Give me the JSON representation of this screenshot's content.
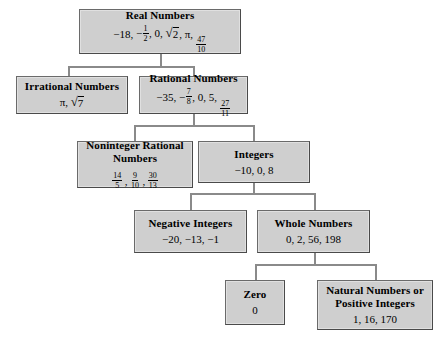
{
  "diagram": {
    "type": "tree",
    "fill_color": "#cfcfcf",
    "border_color": "#6a6a6a",
    "line_color": "#8a8a8a",
    "nodes": {
      "real": {
        "title": "Real Numbers",
        "values_text": "−18, − 1/2, 0, √2, π, 47/10",
        "v1": "−18,",
        "v2": "−",
        "v2_num": "1",
        "v2_den": "2",
        "v2_tail": ", 0,",
        "v3_rand": "2",
        "v3_tail": ", π,",
        "v4_num": "47",
        "v4_den": "10"
      },
      "irrational": {
        "title": "Irrational Numbers",
        "values_text": "π, √7",
        "v1": "π,",
        "v2_rand": "7"
      },
      "rational": {
        "title": "Rational Numbers",
        "values_text": "−35, − 7/8, 0, 5, 27/11",
        "v1": "−35,",
        "v2": "−",
        "v2_num": "7",
        "v2_den": "8",
        "v2_tail": ", 0, 5,",
        "v3_num": "27",
        "v3_den": "11"
      },
      "noninteger": {
        "title_line1": "Noninteger Rational",
        "title_line2": "Numbers",
        "values_text": "14/5, 9/10, 30/13",
        "f1_num": "14",
        "f1_den": "5",
        "sep1": ",",
        "f2_num": "9",
        "f2_den": "10",
        "sep2": ",",
        "f3_num": "30",
        "f3_den": "13"
      },
      "integers": {
        "title": "Integers",
        "values_text": "−10, 0, 8"
      },
      "negative_integers": {
        "title": "Negative Integers",
        "values_text": "−20, −13, −1"
      },
      "whole": {
        "title": "Whole Numbers",
        "values_text": "0, 2, 56, 198"
      },
      "zero": {
        "title": "Zero",
        "values_text": "0"
      },
      "natural": {
        "title_line1": "Natural Numbers or",
        "title_line2": "Positive Integers",
        "values_text": "1, 16, 170"
      }
    }
  }
}
